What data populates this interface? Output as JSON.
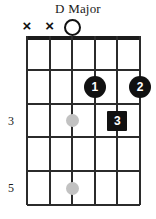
{
  "chord": {
    "title": "D Major",
    "instrument": "guitar",
    "string_count": 6,
    "fret_rows": 5,
    "colors": {
      "ink": "#1c1c1c",
      "grid": "#2b2b2b",
      "marker_fill": "#111111",
      "marker_text": "#ffffff",
      "inlay": "#c2c2c2",
      "background": "#ffffff"
    },
    "open_muted_markers": [
      {
        "string": 1,
        "symbol": "x",
        "name": "muted"
      },
      {
        "string": 2,
        "symbol": "x",
        "name": "muted"
      },
      {
        "string": 3,
        "symbol": "o",
        "name": "open"
      }
    ],
    "fret_numbers": [
      {
        "row": 3,
        "label": "3"
      },
      {
        "row": 5,
        "label": "5"
      }
    ],
    "inlay_dots": [
      {
        "string": 3,
        "row": 3
      },
      {
        "string": 3,
        "row": 5
      }
    ],
    "finger_positions": [
      {
        "string": 4,
        "row": 2,
        "finger": "1",
        "shape": "circle"
      },
      {
        "string": 6,
        "row": 2,
        "finger": "2",
        "shape": "circle"
      },
      {
        "string": 5,
        "row": 3,
        "finger": "3",
        "shape": "square"
      }
    ]
  }
}
